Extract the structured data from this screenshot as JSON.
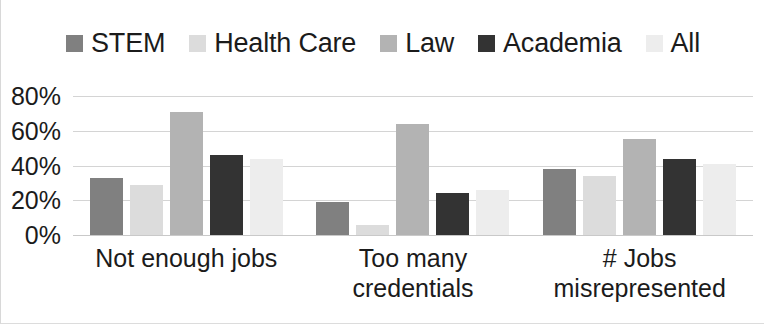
{
  "chart_data": {
    "type": "bar",
    "title": "",
    "subtitle": "",
    "xlabel": "",
    "ylabel": "",
    "ylim": [
      0,
      80
    ],
    "ytick_values": [
      80,
      60,
      40,
      20,
      0
    ],
    "ytick_labels": [
      "80%",
      "60%",
      "40%",
      "20%",
      "0%"
    ],
    "grid": true,
    "legend_position": "top",
    "categories": [
      "Not enough jobs",
      "Too many credentials",
      "# Jobs misrepresented"
    ],
    "category_lines": [
      [
        "Not enough jobs"
      ],
      [
        "Too many",
        "credentials"
      ],
      [
        "# Jobs",
        "misrepresented"
      ]
    ],
    "series": [
      {
        "name": "STEM",
        "color": "#808080",
        "values": [
          33,
          19,
          38
        ]
      },
      {
        "name": "Health Care",
        "color": "#dcdcdc",
        "values": [
          29,
          6,
          34
        ]
      },
      {
        "name": "Law",
        "color": "#b3b3b3",
        "values": [
          71,
          64,
          55
        ]
      },
      {
        "name": "Academia",
        "color": "#333333",
        "values": [
          46,
          24,
          44
        ]
      },
      {
        "name": "All",
        "color": "#ededed",
        "values": [
          44,
          26,
          41
        ]
      }
    ]
  }
}
